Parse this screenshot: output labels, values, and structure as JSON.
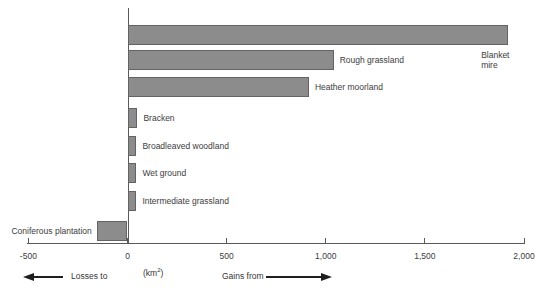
{
  "chart_data": {
    "type": "bar",
    "orientation": "horizontal",
    "title": "",
    "xlabel": "(km2)",
    "ylabel": "",
    "categories": [
      "Blanket mire",
      "Rough grassland",
      "Heather moorland",
      "Bracken",
      "Broadleaved woodland",
      "Wet ground",
      "Intermediate grassland",
      "Coniferous plantation"
    ],
    "values": [
      1920,
      1040,
      915,
      50,
      45,
      45,
      45,
      -155
    ],
    "xlim": [
      -500,
      2000
    ],
    "x_ticks": [
      -500,
      0,
      500,
      1000,
      1500,
      2000
    ],
    "x_tick_labels": [
      "-500",
      "0",
      "500",
      "1,000",
      "1,500",
      "2,000"
    ],
    "grid": "off",
    "legend_position": "bottom",
    "bar_color": "#8c8c8c",
    "bar_border_color": "#636363",
    "axis_color": "#5a5a5a",
    "text_color": "#3c3c3c",
    "category_label_positions": [
      "below-end",
      "right",
      "right",
      "right",
      "right",
      "right",
      "right",
      "left"
    ]
  },
  "axis_legend": {
    "losses_label": "Losses to",
    "gains_label": "Gains from",
    "unit_prefix": "(km",
    "unit_sup": "2",
    "unit_suffix": ")"
  }
}
